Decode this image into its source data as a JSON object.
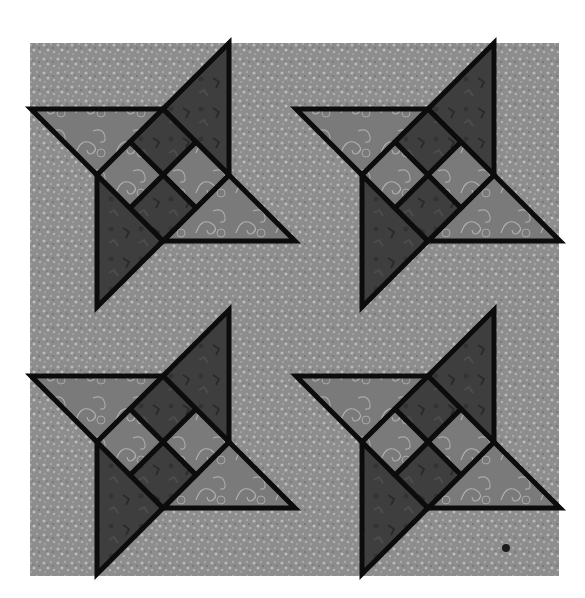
{
  "image": {
    "description": "Quilt design: four pinwheel star blocks arranged in a 2x2 grid on a speckled gray background",
    "width": 585,
    "height": 598
  },
  "background_panel": {
    "x": 30,
    "y": 43,
    "width": 529,
    "height": 533,
    "color": "#8a8a8a"
  },
  "unit": 66,
  "outline": {
    "color": "#0c0c0c",
    "width": 5
  },
  "colors": {
    "background": "#8d8d8d",
    "light_fabric": "#7a7a7a",
    "dark_fabric": "#3e3e3e",
    "swirl": "#b4b4b4",
    "speckle": "#b8b8b8"
  },
  "blocks": [
    {
      "name": "block-top-left",
      "x": 31,
      "y": 43
    },
    {
      "name": "block-top-right",
      "x": 296,
      "y": 43
    },
    {
      "name": "block-bottom-left",
      "x": 31,
      "y": 310
    },
    {
      "name": "block-bottom-right",
      "x": 296,
      "y": 310
    }
  ],
  "marks": [
    {
      "name": "stray-dot",
      "x": 506,
      "y": 548,
      "r": 4
    }
  ]
}
